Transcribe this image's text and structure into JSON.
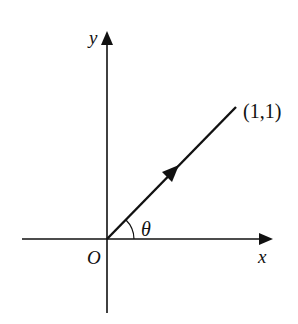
{
  "diagram": {
    "type": "coordinate-vector",
    "axes": {
      "x_label": "x",
      "y_label": "y",
      "origin_label": "O"
    },
    "vector": {
      "from": "O",
      "to_label": "(1,1)",
      "direction_arrow": true
    },
    "angle": {
      "label": "θ",
      "between": [
        "x-axis",
        "vector"
      ]
    },
    "colors": {
      "stroke": "#111111",
      "background": "#ffffff"
    }
  }
}
